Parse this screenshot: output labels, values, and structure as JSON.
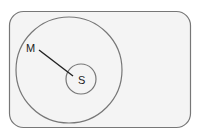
{
  "diagram": {
    "type": "euler",
    "universe": {
      "label": ""
    },
    "sets": [
      {
        "id": "M",
        "label": "M",
        "contains": [
          "S"
        ]
      },
      {
        "id": "S",
        "label": "S"
      }
    ],
    "connector": {
      "from": "M",
      "to": "S"
    }
  },
  "colors": {
    "background": "#ffffff",
    "universe_fill": "#f4f4f4",
    "stroke": "#777777",
    "line": "#222222"
  }
}
